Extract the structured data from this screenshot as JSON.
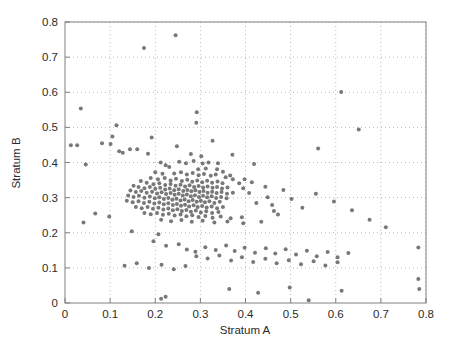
{
  "figure": {
    "background_color": "#ffffff",
    "axes_color": "#808080",
    "grid_color": "#b9b9b9",
    "marker_color": "#5a5a5a",
    "text_color": "#2b2b2b"
  },
  "chart_data": {
    "type": "scatter",
    "title": "",
    "xlabel": "Stratum A",
    "ylabel": "Stratum B",
    "xlim": [
      0,
      0.8
    ],
    "ylim": [
      0,
      0.8
    ],
    "xticks": [
      0,
      0.1,
      0.2,
      0.3,
      0.4,
      0.5,
      0.6,
      0.7,
      0.8
    ],
    "xticklabels": [
      "0",
      "0.1",
      "0.2",
      "0.3",
      "0.4",
      "0.5",
      "0.6",
      "0.7",
      "0.8"
    ],
    "yticks": [
      0,
      0.1,
      0.2,
      0.3,
      0.4,
      0.5,
      0.6,
      0.7,
      0.8
    ],
    "yticklabels": [
      "0",
      "0.1",
      "0.2",
      "0.3",
      "0.4",
      "0.5",
      "0.6",
      "0.7",
      "0.8"
    ],
    "grid": true,
    "grid_style": "dotted",
    "legend": null,
    "marker": "dot",
    "marker_size": 2.0,
    "series": [
      {
        "name": "observations",
        "color": "#5a5a5a",
        "points": [
          [
            0.245,
            0.762
          ],
          [
            0.175,
            0.726
          ],
          [
            0.612,
            0.601
          ],
          [
            0.292,
            0.543
          ],
          [
            0.035,
            0.554
          ],
          [
            0.291,
            0.513
          ],
          [
            0.114,
            0.506
          ],
          [
            0.651,
            0.494
          ],
          [
            0.105,
            0.474
          ],
          [
            0.192,
            0.471
          ],
          [
            0.327,
            0.462
          ],
          [
            0.013,
            0.449
          ],
          [
            0.027,
            0.449
          ],
          [
            0.082,
            0.455
          ],
          [
            0.101,
            0.453
          ],
          [
            0.144,
            0.438
          ],
          [
            0.16,
            0.438
          ],
          [
            0.248,
            0.446
          ],
          [
            0.12,
            0.432
          ],
          [
            0.128,
            0.428
          ],
          [
            0.561,
            0.44
          ],
          [
            0.184,
            0.425
          ],
          [
            0.279,
            0.424
          ],
          [
            0.302,
            0.418
          ],
          [
            0.212,
            0.4
          ],
          [
            0.046,
            0.394
          ],
          [
            0.253,
            0.402
          ],
          [
            0.268,
            0.398
          ],
          [
            0.285,
            0.404
          ],
          [
            0.305,
            0.397
          ],
          [
            0.318,
            0.4
          ],
          [
            0.339,
            0.398
          ],
          [
            0.223,
            0.392
          ],
          [
            0.231,
            0.387
          ],
          [
            0.295,
            0.381
          ],
          [
            0.312,
            0.383
          ],
          [
            0.337,
            0.381
          ],
          [
            0.35,
            0.374
          ],
          [
            0.2,
            0.372
          ],
          [
            0.216,
            0.368
          ],
          [
            0.242,
            0.369
          ],
          [
            0.257,
            0.372
          ],
          [
            0.27,
            0.366
          ],
          [
            0.283,
            0.37
          ],
          [
            0.296,
            0.364
          ],
          [
            0.308,
            0.367
          ],
          [
            0.323,
            0.362
          ],
          [
            0.334,
            0.366
          ],
          [
            0.356,
            0.358
          ],
          [
            0.372,
            0.352
          ],
          [
            0.19,
            0.356
          ],
          [
            0.206,
            0.352
          ],
          [
            0.221,
            0.356
          ],
          [
            0.234,
            0.349
          ],
          [
            0.246,
            0.354
          ],
          [
            0.259,
            0.347
          ],
          [
            0.271,
            0.351
          ],
          [
            0.282,
            0.345
          ],
          [
            0.293,
            0.349
          ],
          [
            0.304,
            0.344
          ],
          [
            0.315,
            0.348
          ],
          [
            0.326,
            0.342
          ],
          [
            0.338,
            0.346
          ],
          [
            0.349,
            0.341
          ],
          [
            0.168,
            0.347
          ],
          [
            0.181,
            0.342
          ],
          [
            0.196,
            0.338
          ],
          [
            0.209,
            0.341
          ],
          [
            0.222,
            0.336
          ],
          [
            0.234,
            0.339
          ],
          [
            0.245,
            0.334
          ],
          [
            0.256,
            0.337
          ],
          [
            0.266,
            0.332
          ],
          [
            0.276,
            0.335
          ],
          [
            0.286,
            0.33
          ],
          [
            0.296,
            0.333
          ],
          [
            0.306,
            0.329
          ],
          [
            0.316,
            0.332
          ],
          [
            0.327,
            0.328
          ],
          [
            0.337,
            0.33
          ],
          [
            0.348,
            0.326
          ],
          [
            0.36,
            0.329
          ],
          [
            0.152,
            0.334
          ],
          [
            0.163,
            0.33
          ],
          [
            0.176,
            0.327
          ],
          [
            0.188,
            0.33
          ],
          [
            0.2,
            0.325
          ],
          [
            0.211,
            0.328
          ],
          [
            0.222,
            0.323
          ],
          [
            0.232,
            0.326
          ],
          [
            0.242,
            0.321
          ],
          [
            0.252,
            0.324
          ],
          [
            0.262,
            0.319
          ],
          [
            0.271,
            0.322
          ],
          [
            0.28,
            0.318
          ],
          [
            0.289,
            0.321
          ],
          [
            0.298,
            0.316
          ],
          [
            0.307,
            0.319
          ],
          [
            0.316,
            0.314
          ],
          [
            0.326,
            0.317
          ],
          [
            0.336,
            0.313
          ],
          [
            0.347,
            0.316
          ],
          [
            0.359,
            0.311
          ],
          [
            0.372,
            0.314
          ],
          [
            0.145,
            0.32
          ],
          [
            0.157,
            0.316
          ],
          [
            0.169,
            0.319
          ],
          [
            0.181,
            0.314
          ],
          [
            0.193,
            0.317
          ],
          [
            0.204,
            0.312
          ],
          [
            0.214,
            0.315
          ],
          [
            0.224,
            0.31
          ],
          [
            0.234,
            0.313
          ],
          [
            0.243,
            0.308
          ],
          [
            0.252,
            0.311
          ],
          [
            0.261,
            0.306
          ],
          [
            0.27,
            0.309
          ],
          [
            0.279,
            0.304
          ],
          [
            0.288,
            0.307
          ],
          [
            0.297,
            0.302
          ],
          [
            0.306,
            0.305
          ],
          [
            0.315,
            0.301
          ],
          [
            0.325,
            0.304
          ],
          [
            0.335,
            0.299
          ],
          [
            0.346,
            0.302
          ],
          [
            0.358,
            0.298
          ],
          [
            0.14,
            0.306
          ],
          [
            0.152,
            0.302
          ],
          [
            0.164,
            0.305
          ],
          [
            0.176,
            0.3
          ],
          [
            0.188,
            0.303
          ],
          [
            0.199,
            0.298
          ],
          [
            0.209,
            0.301
          ],
          [
            0.219,
            0.296
          ],
          [
            0.229,
            0.299
          ],
          [
            0.238,
            0.294
          ],
          [
            0.247,
            0.297
          ],
          [
            0.256,
            0.292
          ],
          [
            0.265,
            0.295
          ],
          [
            0.274,
            0.29
          ],
          [
            0.283,
            0.293
          ],
          [
            0.292,
            0.288
          ],
          [
            0.301,
            0.291
          ],
          [
            0.31,
            0.287
          ],
          [
            0.32,
            0.29
          ],
          [
            0.331,
            0.285
          ],
          [
            0.343,
            0.288
          ],
          [
            0.137,
            0.291
          ],
          [
            0.15,
            0.287
          ],
          [
            0.163,
            0.29
          ],
          [
            0.175,
            0.285
          ],
          [
            0.187,
            0.288
          ],
          [
            0.198,
            0.283
          ],
          [
            0.209,
            0.286
          ],
          [
            0.219,
            0.281
          ],
          [
            0.229,
            0.284
          ],
          [
            0.239,
            0.279
          ],
          [
            0.248,
            0.282
          ],
          [
            0.257,
            0.277
          ],
          [
            0.266,
            0.28
          ],
          [
            0.275,
            0.275
          ],
          [
            0.285,
            0.278
          ],
          [
            0.294,
            0.273
          ],
          [
            0.304,
            0.276
          ],
          [
            0.314,
            0.272
          ],
          [
            0.325,
            0.275
          ],
          [
            0.337,
            0.27
          ],
          [
            0.35,
            0.273
          ],
          [
            0.157,
            0.273
          ],
          [
            0.17,
            0.27
          ],
          [
            0.183,
            0.273
          ],
          [
            0.195,
            0.268
          ],
          [
            0.207,
            0.271
          ],
          [
            0.218,
            0.266
          ],
          [
            0.229,
            0.269
          ],
          [
            0.239,
            0.264
          ],
          [
            0.249,
            0.267
          ],
          [
            0.259,
            0.262
          ],
          [
            0.269,
            0.265
          ],
          [
            0.279,
            0.26
          ],
          [
            0.29,
            0.263
          ],
          [
            0.301,
            0.258
          ],
          [
            0.313,
            0.261
          ],
          [
            0.326,
            0.256
          ],
          [
            0.34,
            0.259
          ],
          [
            0.176,
            0.256
          ],
          [
            0.19,
            0.253
          ],
          [
            0.204,
            0.256
          ],
          [
            0.217,
            0.251
          ],
          [
            0.23,
            0.254
          ],
          [
            0.243,
            0.249
          ],
          [
            0.256,
            0.252
          ],
          [
            0.269,
            0.247
          ],
          [
            0.282,
            0.25
          ],
          [
            0.296,
            0.245
          ],
          [
            0.311,
            0.248
          ],
          [
            0.327,
            0.243
          ],
          [
            0.345,
            0.246
          ],
          [
            0.367,
            0.241
          ],
          [
            0.392,
            0.244
          ],
          [
            0.213,
            0.237
          ],
          [
            0.235,
            0.233
          ],
          [
            0.258,
            0.236
          ],
          [
            0.281,
            0.231
          ],
          [
            0.305,
            0.234
          ],
          [
            0.331,
            0.229
          ],
          [
            0.36,
            0.232
          ],
          [
            0.395,
            0.227
          ],
          [
            0.435,
            0.231
          ],
          [
            0.067,
            0.255
          ],
          [
            0.098,
            0.246
          ],
          [
            0.041,
            0.229
          ],
          [
            0.424,
            0.285
          ],
          [
            0.459,
            0.279
          ],
          [
            0.463,
            0.262
          ],
          [
            0.472,
            0.252
          ],
          [
            0.449,
            0.301
          ],
          [
            0.408,
            0.313
          ],
          [
            0.395,
            0.327
          ],
          [
            0.386,
            0.341
          ],
          [
            0.398,
            0.352
          ],
          [
            0.414,
            0.344
          ],
          [
            0.444,
            0.331
          ],
          [
            0.484,
            0.322
          ],
          [
            0.502,
            0.296
          ],
          [
            0.526,
            0.271
          ],
          [
            0.419,
            0.396
          ],
          [
            0.366,
            0.363
          ],
          [
            0.371,
            0.422
          ],
          [
            0.556,
            0.311
          ],
          [
            0.596,
            0.289
          ],
          [
            0.636,
            0.264
          ],
          [
            0.675,
            0.237
          ],
          [
            0.711,
            0.216
          ],
          [
            0.148,
            0.204
          ],
          [
            0.207,
            0.196
          ],
          [
            0.196,
            0.176
          ],
          [
            0.224,
            0.163
          ],
          [
            0.252,
            0.167
          ],
          [
            0.27,
            0.152
          ],
          [
            0.289,
            0.146
          ],
          [
            0.311,
            0.159
          ],
          [
            0.334,
            0.151
          ],
          [
            0.357,
            0.164
          ],
          [
            0.376,
            0.148
          ],
          [
            0.398,
            0.157
          ],
          [
            0.421,
            0.143
          ],
          [
            0.445,
            0.156
          ],
          [
            0.466,
            0.141
          ],
          [
            0.489,
            0.153
          ],
          [
            0.512,
            0.138
          ],
          [
            0.536,
            0.149
          ],
          [
            0.558,
            0.133
          ],
          [
            0.582,
            0.145
          ],
          [
            0.604,
            0.13
          ],
          [
            0.628,
            0.142
          ],
          [
            0.783,
            0.158
          ],
          [
            0.291,
            0.133
          ],
          [
            0.316,
            0.127
          ],
          [
            0.342,
            0.135
          ],
          [
            0.368,
            0.121
          ],
          [
            0.392,
            0.13
          ],
          [
            0.417,
            0.117
          ],
          [
            0.444,
            0.126
          ],
          [
            0.469,
            0.113
          ],
          [
            0.496,
            0.122
          ],
          [
            0.523,
            0.11
          ],
          [
            0.551,
            0.119
          ],
          [
            0.577,
            0.107
          ],
          [
            0.604,
            0.116
          ],
          [
            0.132,
            0.106
          ],
          [
            0.159,
            0.113
          ],
          [
            0.186,
            0.1
          ],
          [
            0.214,
            0.109
          ],
          [
            0.241,
            0.096
          ],
          [
            0.267,
            0.105
          ],
          [
            0.213,
            0.012
          ],
          [
            0.364,
            0.04
          ],
          [
            0.428,
            0.029
          ],
          [
            0.498,
            0.044
          ],
          [
            0.54,
            0.008
          ],
          [
            0.613,
            0.035
          ],
          [
            0.785,
            0.04
          ],
          [
            0.783,
            0.068
          ],
          [
            0.223,
            0.018
          ]
        ]
      }
    ]
  },
  "axis_titles": {
    "x": "Stratum A",
    "y": "Stratum B"
  }
}
